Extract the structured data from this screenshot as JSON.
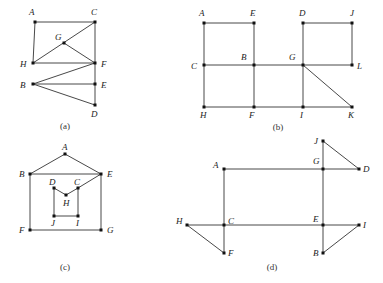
{
  "figures": [
    {
      "id": "a",
      "caption": "(a)",
      "caption_pos": [
        65,
        129
      ],
      "nodes": [
        {
          "name": "A",
          "x": 35,
          "y": 22,
          "lx": 29,
          "ly": 15
        },
        {
          "name": "C",
          "x": 95,
          "y": 22,
          "lx": 91,
          "ly": 15
        },
        {
          "name": "G",
          "x": 64,
          "y": 43,
          "lx": 55,
          "ly": 40
        },
        {
          "name": "H",
          "x": 33,
          "y": 63,
          "lx": 20,
          "ly": 67
        },
        {
          "name": "F",
          "x": 95,
          "y": 63,
          "lx": 101,
          "ly": 67
        },
        {
          "name": "B",
          "x": 33,
          "y": 84,
          "lx": 20,
          "ly": 88
        },
        {
          "name": "E",
          "x": 95,
          "y": 84,
          "lx": 101,
          "ly": 88
        },
        {
          "name": "D",
          "x": 95,
          "y": 105,
          "lx": 91,
          "ly": 117
        }
      ],
      "edges": [
        [
          "A",
          "C"
        ],
        [
          "A",
          "H"
        ],
        [
          "C",
          "F"
        ],
        [
          "C",
          "H"
        ],
        [
          "G",
          "F"
        ],
        [
          "H",
          "F"
        ],
        [
          "B",
          "F"
        ],
        [
          "B",
          "E"
        ],
        [
          "B",
          "D"
        ],
        [
          "F",
          "E"
        ],
        [
          "E",
          "D"
        ]
      ]
    },
    {
      "id": "b",
      "caption": "(b)",
      "caption_pos": [
        278,
        130
      ],
      "nodes": [
        {
          "name": "A",
          "x": 204,
          "y": 23,
          "lx": 199,
          "ly": 16
        },
        {
          "name": "E",
          "x": 254,
          "y": 23,
          "lx": 250,
          "ly": 16
        },
        {
          "name": "D",
          "x": 303,
          "y": 23,
          "lx": 299,
          "ly": 16
        },
        {
          "name": "J",
          "x": 352,
          "y": 23,
          "lx": 350,
          "ly": 16
        },
        {
          "name": "C",
          "x": 204,
          "y": 65,
          "lx": 191,
          "ly": 69
        },
        {
          "name": "B",
          "x": 254,
          "y": 65,
          "lx": 241,
          "ly": 60
        },
        {
          "name": "G",
          "x": 303,
          "y": 65,
          "lx": 289,
          "ly": 60
        },
        {
          "name": "L",
          "x": 352,
          "y": 65,
          "lx": 357,
          "ly": 69
        },
        {
          "name": "H",
          "x": 204,
          "y": 107,
          "lx": 200,
          "ly": 118
        },
        {
          "name": "F",
          "x": 254,
          "y": 107,
          "lx": 249,
          "ly": 118
        },
        {
          "name": "I",
          "x": 303,
          "y": 107,
          "lx": 300,
          "ly": 118
        },
        {
          "name": "K",
          "x": 352,
          "y": 107,
          "lx": 348,
          "ly": 118
        }
      ],
      "edges": [
        [
          "A",
          "E"
        ],
        [
          "A",
          "C"
        ],
        [
          "E",
          "B"
        ],
        [
          "C",
          "B"
        ],
        [
          "B",
          "G"
        ],
        [
          "C",
          "H"
        ],
        [
          "B",
          "F"
        ],
        [
          "H",
          "F"
        ],
        [
          "F",
          "I"
        ],
        [
          "I",
          "K"
        ],
        [
          "G",
          "I"
        ],
        [
          "G",
          "K"
        ],
        [
          "D",
          "G"
        ],
        [
          "D",
          "J"
        ],
        [
          "J",
          "L"
        ],
        [
          "G",
          "L"
        ]
      ]
    },
    {
      "id": "c",
      "caption": "(c)",
      "caption_pos": [
        65,
        270
      ],
      "nodes": [
        {
          "name": "A",
          "x": 65,
          "y": 154,
          "lx": 62,
          "ly": 150
        },
        {
          "name": "B",
          "x": 30,
          "y": 174,
          "lx": 19,
          "ly": 177
        },
        {
          "name": "E",
          "x": 101,
          "y": 174,
          "lx": 107,
          "ly": 177
        },
        {
          "name": "D",
          "x": 54,
          "y": 188,
          "lx": 49,
          "ly": 185
        },
        {
          "name": "C",
          "x": 78,
          "y": 188,
          "lx": 74,
          "ly": 185
        },
        {
          "name": "H",
          "x": 66,
          "y": 195,
          "lx": 63,
          "ly": 206
        },
        {
          "name": "J",
          "x": 54,
          "y": 216,
          "lx": 51,
          "ly": 226
        },
        {
          "name": "I",
          "x": 78,
          "y": 216,
          "lx": 76,
          "ly": 226
        },
        {
          "name": "F",
          "x": 30,
          "y": 230,
          "lx": 19,
          "ly": 233
        },
        {
          "name": "G",
          "x": 101,
          "y": 230,
          "lx": 107,
          "ly": 233
        }
      ],
      "edges": [
        [
          "A",
          "B"
        ],
        [
          "A",
          "E"
        ],
        [
          "B",
          "E"
        ],
        [
          "B",
          "F"
        ],
        [
          "E",
          "G"
        ],
        [
          "F",
          "G"
        ],
        [
          "E",
          "C"
        ],
        [
          "D",
          "H"
        ],
        [
          "H",
          "C"
        ],
        [
          "D",
          "J"
        ],
        [
          "C",
          "I"
        ],
        [
          "J",
          "I"
        ]
      ]
    },
    {
      "id": "d",
      "caption": "(d)",
      "caption_pos": [
        272,
        270
      ],
      "nodes": [
        {
          "name": "J",
          "x": 323,
          "y": 141,
          "lx": 314,
          "ly": 144
        },
        {
          "name": "A",
          "x": 224,
          "y": 169,
          "lx": 213,
          "ly": 168
        },
        {
          "name": "G",
          "x": 323,
          "y": 169,
          "lx": 313,
          "ly": 164
        },
        {
          "name": "D",
          "x": 359,
          "y": 169,
          "lx": 363,
          "ly": 172
        },
        {
          "name": "H",
          "x": 187,
          "y": 225,
          "lx": 176,
          "ly": 224
        },
        {
          "name": "C",
          "x": 224,
          "y": 225,
          "lx": 228,
          "ly": 224
        },
        {
          "name": "E",
          "x": 323,
          "y": 225,
          "lx": 313,
          "ly": 222
        },
        {
          "name": "I",
          "x": 359,
          "y": 225,
          "lx": 363,
          "ly": 228
        },
        {
          "name": "F",
          "x": 224,
          "y": 253,
          "lx": 228,
          "ly": 256
        },
        {
          "name": "B",
          "x": 323,
          "y": 253,
          "lx": 313,
          "ly": 256
        }
      ],
      "edges": [
        [
          "J",
          "G"
        ],
        [
          "J",
          "D"
        ],
        [
          "A",
          "G"
        ],
        [
          "G",
          "D"
        ],
        [
          "A",
          "C"
        ],
        [
          "G",
          "E"
        ],
        [
          "H",
          "C"
        ],
        [
          "C",
          "E"
        ],
        [
          "E",
          "I"
        ],
        [
          "H",
          "F"
        ],
        [
          "C",
          "F"
        ],
        [
          "E",
          "B"
        ],
        [
          "B",
          "I"
        ]
      ]
    }
  ]
}
